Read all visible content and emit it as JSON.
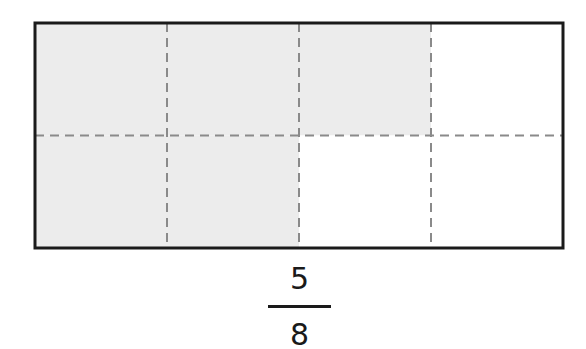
{
  "diagram": {
    "type": "fraction-area-model",
    "rows": 2,
    "cols": 4,
    "shaded_cells": [
      [
        0,
        0
      ],
      [
        0,
        1
      ],
      [
        0,
        2
      ],
      [
        1,
        0
      ],
      [
        1,
        1
      ]
    ],
    "colors": {
      "shade": "#ececec",
      "unshaded": "#ffffff",
      "border": "#1a1a1a",
      "divider": "#8a8a8a"
    }
  },
  "fraction": {
    "numerator": "5",
    "denominator": "8"
  }
}
